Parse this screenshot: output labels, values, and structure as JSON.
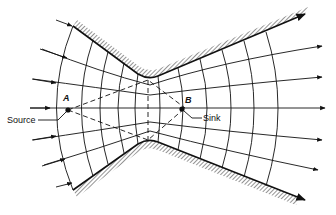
{
  "diagram": {
    "type": "flow-net",
    "labels": {
      "point_a": "A",
      "point_b": "B",
      "source": "Source",
      "sink": "Sink"
    },
    "colors": {
      "line": "#111111",
      "background": "#ffffff"
    }
  }
}
